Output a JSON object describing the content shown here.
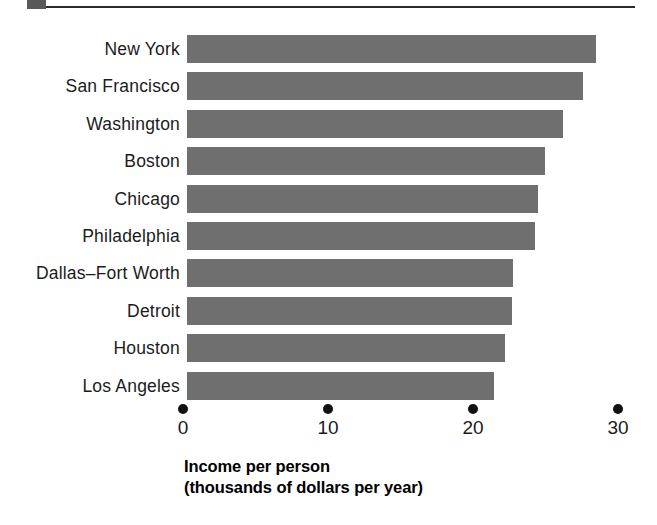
{
  "decoration": {
    "square_color": "#595959",
    "rule_color": "#2b2b2b"
  },
  "chart_data": {
    "type": "bar",
    "orientation": "horizontal",
    "title": "",
    "subtitle": "",
    "xlabel": "Income per person",
    "xlabel_line2": "(thousands of dollars per year)",
    "ylabel": "",
    "categories": [
      "New York",
      "San Francisco",
      "Washington",
      "Boston",
      "Chicago",
      "Philadelphia",
      "Dallas–Fort Worth",
      "Detroit",
      "Houston",
      "Los Angeles"
    ],
    "values": [
      28.2,
      27.3,
      25.9,
      24.7,
      24.2,
      24.0,
      22.5,
      22.4,
      21.9,
      21.2
    ],
    "xlim": [
      0,
      30
    ],
    "xticks": [
      0,
      10,
      20,
      30
    ],
    "xticklabels": [
      "0",
      "10",
      "20",
      "30"
    ],
    "tick_marker": "dot",
    "grid": false,
    "legend": false,
    "bar_color": "#6f6f6f",
    "units": "thousands of dollars per year"
  }
}
